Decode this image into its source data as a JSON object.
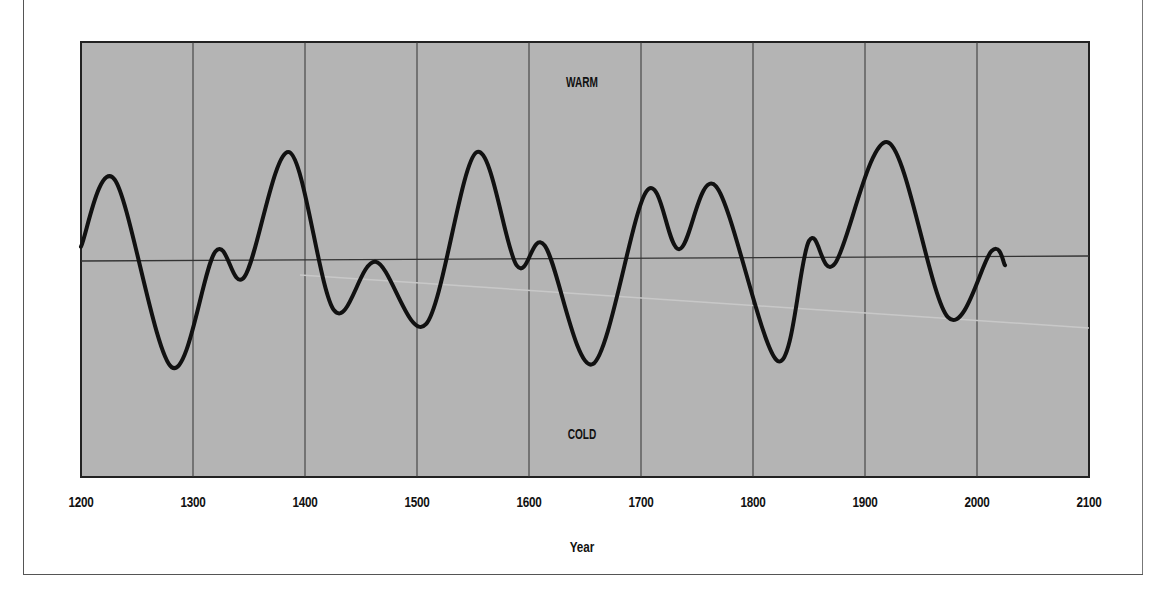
{
  "chart_data": {
    "type": "line",
    "title": "",
    "xlabel": "Year",
    "ylabel": "",
    "xlim": [
      1200,
      2100
    ],
    "ylim": [
      -1.8,
      2.0
    ],
    "x_ticks": [
      1200,
      1300,
      1400,
      1500,
      1600,
      1700,
      1800,
      1900,
      2000,
      2100
    ],
    "grid": {
      "vertical": true,
      "horizontal": false,
      "zero_line": true
    },
    "annotations": [
      {
        "text": "WARM",
        "position": "top-center"
      },
      {
        "text": "COLD",
        "position": "bottom-center"
      }
    ],
    "series": [
      {
        "name": "Temperature anomaly (relative)",
        "x": [
          1200,
          1230,
          1281,
          1320,
          1346,
          1386,
          1426,
          1463,
          1508,
          1553,
          1589,
          1614,
          1657,
          1705,
          1734,
          1767,
          1822,
          1850,
          1873,
          1921,
          1974,
          2013,
          2025
        ],
        "values": [
          0.13,
          0.74,
          -0.97,
          0.08,
          -0.15,
          0.98,
          -0.46,
          -0.02,
          -0.59,
          0.97,
          -0.06,
          0.12,
          -0.96,
          0.61,
          0.08,
          0.65,
          -0.94,
          0.15,
          -0.06,
          1.04,
          -0.55,
          0.05,
          -0.08
        ]
      }
    ]
  },
  "axis": {
    "x_title": "Year",
    "ticks": [
      "1200",
      "1300",
      "1400",
      "1500",
      "1600",
      "1700",
      "1800",
      "1900",
      "2000",
      "2100"
    ]
  },
  "labels": {
    "warm": "WARM",
    "cold": "COLD"
  },
  "colors": {
    "plot_background": "#b4b4b4",
    "curve": "#111111",
    "grid": "#333333"
  }
}
